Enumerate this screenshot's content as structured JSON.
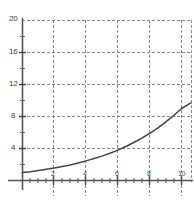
{
  "chart_data": {
    "type": "line",
    "title": "",
    "subtitle": "",
    "xlabel": "",
    "ylabel": "",
    "xlim": [
      0,
      10.6
    ],
    "ylim": [
      0,
      20
    ],
    "grid": true,
    "grid_style": "dashed",
    "legend": false,
    "legend_position": "none",
    "x_ticks": [
      2,
      4,
      6,
      8,
      10
    ],
    "x_tick_labels": [
      "2",
      "4",
      "6",
      "8",
      "10"
    ],
    "y_ticks": [
      4,
      8,
      12,
      16,
      20
    ],
    "y_tick_labels": [
      "4",
      "8",
      "12",
      "16",
      "20"
    ],
    "series": [
      {
        "name": "exponential curve",
        "color": "#444444",
        "x": [
          0,
          0.5,
          1,
          1.5,
          2,
          2.5,
          3,
          3.5,
          4,
          4.5,
          5,
          5.5,
          6,
          6.5,
          7,
          7.5,
          8,
          8.5,
          9,
          9.5,
          10,
          10.6
        ],
        "values": [
          1.0,
          1.1,
          1.25,
          1.4,
          1.55,
          1.75,
          1.95,
          2.2,
          2.45,
          2.75,
          3.05,
          3.4,
          3.8,
          4.25,
          4.75,
          5.3,
          5.9,
          6.55,
          7.3,
          8.1,
          9.0,
          9.7
        ]
      }
    ]
  },
  "style": {
    "background": "#ffffff",
    "axis_color": "#555555",
    "grid_color": "#888888",
    "curve_color": "#444444",
    "label_color": "#3a3a3a"
  }
}
